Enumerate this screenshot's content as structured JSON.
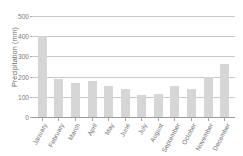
{
  "chart_data": {
    "type": "bar",
    "title": "",
    "subtitle": "",
    "xlabel": "",
    "ylabel": "Precipitation (mm)",
    "categories": [
      "January",
      "February",
      "March",
      "April",
      "May",
      "June",
      "July",
      "August",
      "September",
      "October",
      "November",
      "December"
    ],
    "values": [
      400,
      188,
      168,
      178,
      152,
      140,
      108,
      112,
      153,
      138,
      198,
      262
    ],
    "series": [
      {
        "name": "Precipitation",
        "values": [
          400,
          188,
          168,
          178,
          152,
          140,
          108,
          112,
          153,
          138,
          198,
          262
        ]
      }
    ],
    "ylim": [
      0,
      500
    ],
    "xlim_categories": 12,
    "y_ticks": [
      0,
      100,
      200,
      300,
      400,
      500
    ],
    "y_tick_labels": [
      "0",
      "100",
      "200",
      "300",
      "400",
      "500"
    ],
    "grid": true,
    "grid_axis": "y",
    "legend": false,
    "legend_position": "none",
    "bar_color": "#d6d6d6",
    "grid_color": "#c9c9c9",
    "axis_color": "#9a9a9a",
    "text_color": "#6f6f6f",
    "background": "#ffffff"
  },
  "axis": {
    "y_title": "Precipitation (mm)"
  }
}
